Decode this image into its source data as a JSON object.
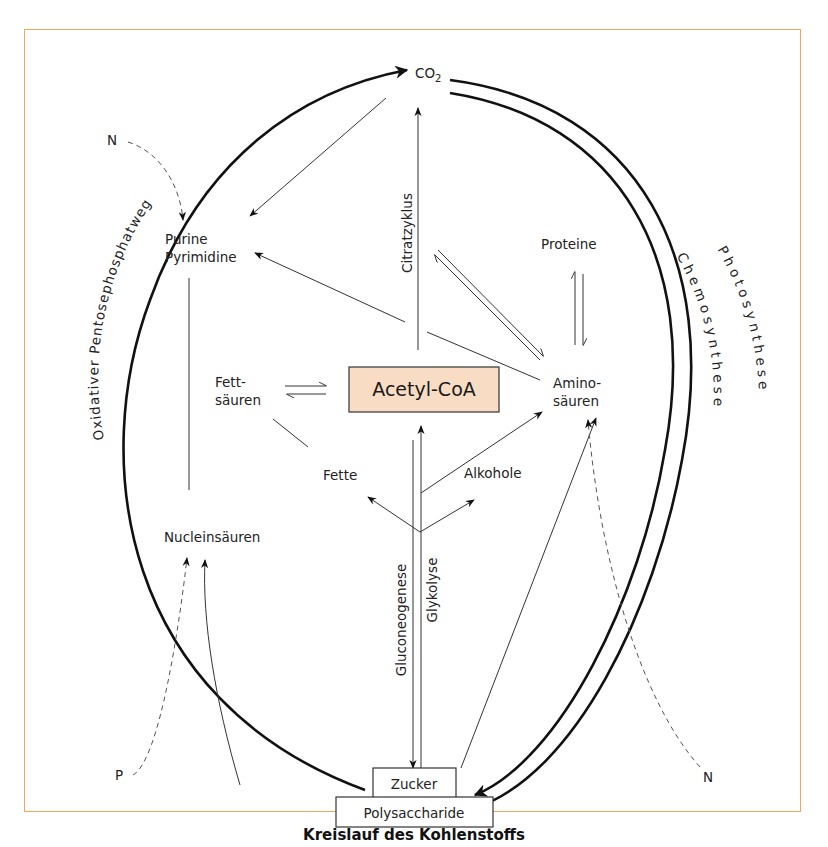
{
  "title": "Kreislauf des Kohlenstoffs",
  "colors": {
    "frame": "#f0a860",
    "acetyl_box_fill": "#f8dcc4",
    "line": "#222222"
  },
  "nodes": {
    "co2": "CO",
    "co2_sub": "2",
    "purine_1": "Purine",
    "purine_2": "Pyrimidine",
    "proteine": "Proteine",
    "fettsaeuren_1": "Fett-",
    "fettsaeuren_2": "säuren",
    "acetyl_coa": "Acetyl-CoA",
    "aminosaeuren_1": "Amino-",
    "aminosaeuren_2": "säuren",
    "fette": "Fette",
    "alkohole": "Alkohole",
    "nucleinsaeuren": "Nucleinsäuren",
    "zucker": "Zucker",
    "polysaccharide": "Polysaccharide",
    "n_top": "N",
    "n_bottom": "N",
    "p": "P"
  },
  "pathways": {
    "citratzyklus": "Citratzyklus",
    "gluconeogenese": "Gluconeogenese",
    "glykolyse": "Glykolyse",
    "pentose": "Oxidativer Pentosephosphatweg",
    "chemosynthese": "Chemosynthese",
    "photosynthese": "Photosynthese"
  }
}
